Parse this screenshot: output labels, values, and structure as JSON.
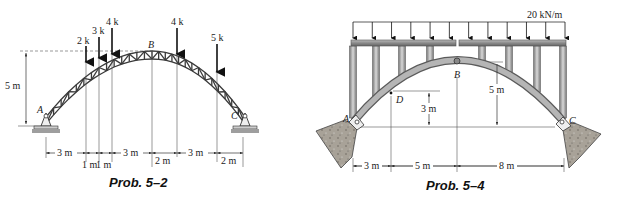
{
  "figures": [
    {
      "id": "prob-5-2",
      "caption": "Prob. 5–2",
      "structure": "three-hinged truss arch",
      "points": {
        "A": "A",
        "B": "B",
        "C": "C"
      },
      "loads": [
        {
          "label": "2 k"
        },
        {
          "label": "3 k"
        },
        {
          "label": "4 k"
        },
        {
          "label": "4 k"
        },
        {
          "label": "5 k"
        }
      ],
      "rise_label": "5 m",
      "dimensions_top": [
        "3 m",
        "3 m",
        "2 m",
        "3 m",
        "2 m"
      ],
      "dimensions_bottom": [
        "1 m",
        "1 m"
      ]
    },
    {
      "id": "prob-5-4",
      "caption": "Prob. 5–4",
      "structure": "three-hinged arch with deck",
      "points": {
        "A": "A",
        "B": "B",
        "C": "C",
        "D": "D"
      },
      "distributed_load": "20 kN/m",
      "heights": {
        "D": "3 m",
        "B": "5 m"
      },
      "dimensions": [
        "3 m",
        "5 m",
        "8 m"
      ]
    }
  ],
  "colors": {
    "line": "#333333",
    "truss": "#3a3a3a",
    "deck": "#8a8a8a",
    "arch": "#9a9a9a",
    "ground": "#9e9e9e",
    "rock": "#a09a90"
  }
}
